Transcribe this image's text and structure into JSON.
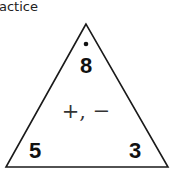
{
  "header": {
    "title": "actice"
  },
  "triangle": {
    "top": "8",
    "bottom_left": "5",
    "bottom_right": "3",
    "operations": "+, −",
    "top_marker": "dot"
  }
}
